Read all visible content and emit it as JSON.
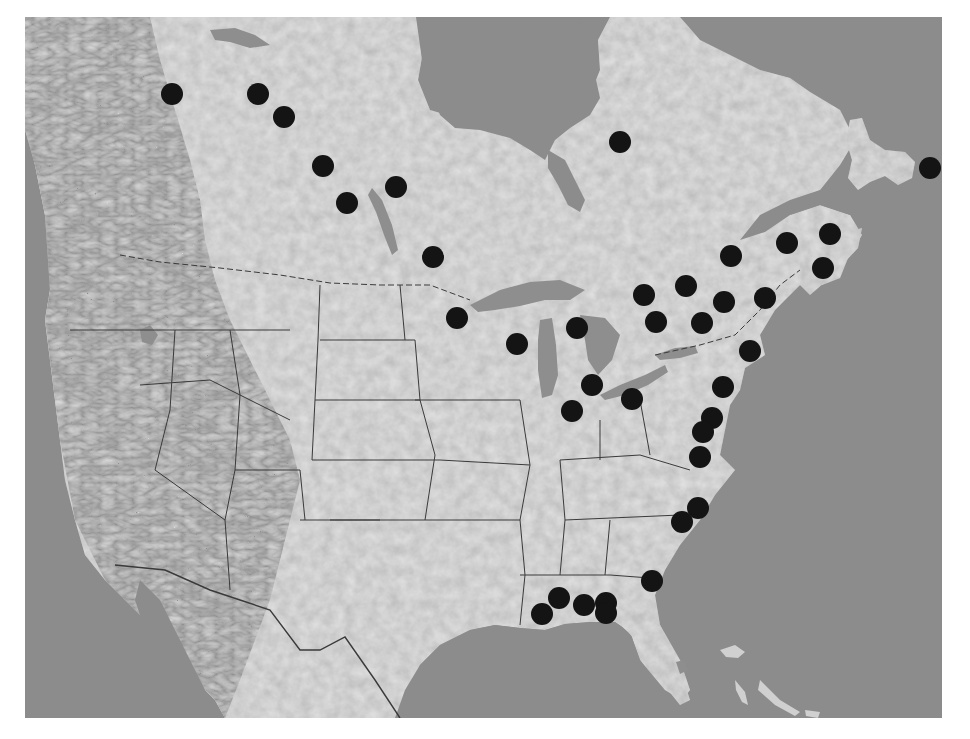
{
  "map": {
    "type": "grayscale shaded-relief map",
    "region": "North America (Canada, United States, northern Mexico)",
    "frame": {
      "x": 25,
      "y": 17,
      "width": 917,
      "height": 701
    },
    "colors": {
      "water": "#8c8c8c",
      "land": "#d9d9d9",
      "land_highlight": "#ececec",
      "land_shadow": "#bdbdbd",
      "lakes": "#8e8e8e",
      "borders": "#3a3a3a",
      "marker": "#141414",
      "page_background": "#ffffff"
    },
    "marker_radius": 11,
    "markers": [
      {
        "region": "northwest-canada",
        "x": 172,
        "y": 94
      },
      {
        "region": "northwest-canada",
        "x": 258,
        "y": 94
      },
      {
        "region": "northwest-canada",
        "x": 284,
        "y": 117
      },
      {
        "region": "central-canada",
        "x": 323,
        "y": 166
      },
      {
        "region": "central-canada",
        "x": 347,
        "y": 203
      },
      {
        "region": "central-canada",
        "x": 396,
        "y": 187
      },
      {
        "region": "central-canada",
        "x": 433,
        "y": 257
      },
      {
        "region": "quebec",
        "x": 620,
        "y": 142
      },
      {
        "region": "newfoundland",
        "x": 930,
        "y": 168
      },
      {
        "region": "maritimes",
        "x": 731,
        "y": 256
      },
      {
        "region": "maritimes",
        "x": 787,
        "y": 243
      },
      {
        "region": "maritimes",
        "x": 830,
        "y": 234
      },
      {
        "region": "maritimes",
        "x": 823,
        "y": 268
      },
      {
        "region": "st-lawrence",
        "x": 686,
        "y": 286
      },
      {
        "region": "st-lawrence",
        "x": 644,
        "y": 295
      },
      {
        "region": "st-lawrence",
        "x": 724,
        "y": 302
      },
      {
        "region": "new-england",
        "x": 765,
        "y": 298
      },
      {
        "region": "st-lawrence",
        "x": 656,
        "y": 322
      },
      {
        "region": "st-lawrence",
        "x": 702,
        "y": 323
      },
      {
        "region": "new-england",
        "x": 750,
        "y": 351
      },
      {
        "region": "great-lakes",
        "x": 457,
        "y": 318
      },
      {
        "region": "great-lakes",
        "x": 517,
        "y": 344
      },
      {
        "region": "great-lakes",
        "x": 577,
        "y": 328
      },
      {
        "region": "great-lakes",
        "x": 592,
        "y": 385
      },
      {
        "region": "great-lakes",
        "x": 572,
        "y": 411
      },
      {
        "region": "great-lakes",
        "x": 632,
        "y": 399
      },
      {
        "region": "atlantic-coast",
        "x": 723,
        "y": 387
      },
      {
        "region": "atlantic-coast",
        "x": 712,
        "y": 418
      },
      {
        "region": "atlantic-coast",
        "x": 703,
        "y": 432
      },
      {
        "region": "atlantic-coast",
        "x": 700,
        "y": 457
      },
      {
        "region": "atlantic-coast",
        "x": 698,
        "y": 508
      },
      {
        "region": "atlantic-coast",
        "x": 682,
        "y": 522
      },
      {
        "region": "atlantic-coast",
        "x": 652,
        "y": 581
      },
      {
        "region": "gulf-coast",
        "x": 559,
        "y": 598
      },
      {
        "region": "gulf-coast",
        "x": 542,
        "y": 614
      },
      {
        "region": "gulf-coast",
        "x": 584,
        "y": 605
      },
      {
        "region": "gulf-coast",
        "x": 606,
        "y": 603
      },
      {
        "region": "gulf-coast",
        "x": 606,
        "y": 613
      }
    ],
    "marker_count": 38
  }
}
